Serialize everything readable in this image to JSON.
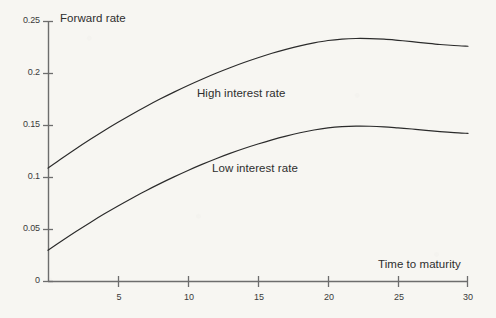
{
  "chart_data": {
    "type": "line",
    "title": "",
    "xlabel": "Time to maturity",
    "ylabel": "Forward rate",
    "xlim": [
      0,
      30
    ],
    "ylim": [
      0,
      0.25
    ],
    "grid": false,
    "legend_position": "inline-annotation",
    "xticks": [
      0,
      5,
      10,
      15,
      20,
      25,
      30
    ],
    "xtick_labels": [
      "",
      "5",
      "10",
      "15",
      "20",
      "25",
      "30"
    ],
    "yticks": [
      0,
      0.05,
      0.1,
      0.15,
      0.2,
      0.25
    ],
    "ytick_labels": [
      "0",
      "0.05",
      "0.1",
      "0.15",
      "0.2",
      "0.25"
    ],
    "x": [
      0,
      1,
      2,
      3,
      4,
      5,
      6,
      7,
      8,
      9,
      10,
      11,
      12,
      13,
      14,
      15,
      16,
      17,
      18,
      19,
      20,
      21,
      22,
      23,
      24,
      25,
      26,
      27,
      28,
      29,
      30
    ],
    "series": [
      {
        "name": "High interest rate",
        "color": "#2b2b2b",
        "values": [
          0.109,
          0.1185,
          0.1277,
          0.1365,
          0.145,
          0.1531,
          0.1609,
          0.1683,
          0.1754,
          0.1821,
          0.1885,
          0.1945,
          0.2002,
          0.2055,
          0.2105,
          0.2151,
          0.2194,
          0.2232,
          0.2266,
          0.2294,
          0.2317,
          0.2331,
          0.2337,
          0.2336,
          0.233,
          0.2319,
          0.2306,
          0.2292,
          0.2279,
          0.2269,
          0.2262
        ]
      },
      {
        "name": "Low interest rate",
        "color": "#2b2b2b",
        "values": [
          0.03,
          0.0392,
          0.0481,
          0.0566,
          0.0648,
          0.0726,
          0.0801,
          0.0873,
          0.0941,
          0.1006,
          0.1068,
          0.1126,
          0.1181,
          0.1232,
          0.1279,
          0.1322,
          0.1362,
          0.1398,
          0.143,
          0.1457,
          0.1477,
          0.1489,
          0.1494,
          0.1493,
          0.1487,
          0.1477,
          0.1466,
          0.1453,
          0.1441,
          0.1431,
          0.1424
        ]
      }
    ],
    "annotations": [
      {
        "text": "High interest rate",
        "x_px": 197,
        "y_px": 87
      },
      {
        "text": "Low interest rate",
        "x_px": 212,
        "y_px": 162
      }
    ]
  },
  "axes": {
    "y_axis_title": "Forward rate",
    "x_axis_title": "Time to maturity"
  },
  "colors": {
    "background": "#f7f6f2",
    "axis": "#6d6d6d",
    "curve": "#2b2b2b",
    "text": "#2e2e2e"
  }
}
